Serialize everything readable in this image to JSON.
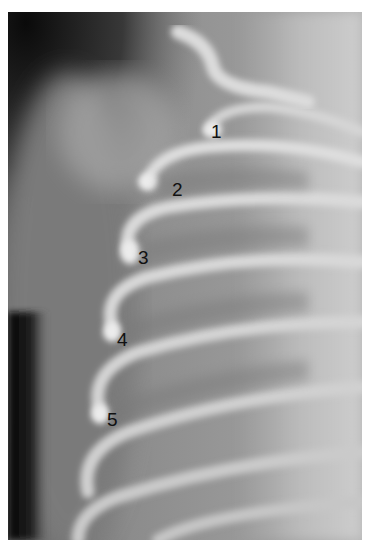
{
  "figure": {
    "caption_remnant": "ʼ ʼ ʼ",
    "labels": [
      {
        "text": "1",
        "x": 211,
        "y": 122
      },
      {
        "text": "2",
        "x": 172,
        "y": 180
      },
      {
        "text": "3",
        "x": 138,
        "y": 248
      },
      {
        "text": "4",
        "x": 117,
        "y": 330
      },
      {
        "text": "5",
        "x": 107,
        "y": 410
      }
    ],
    "colors": {
      "background": "#ffffff",
      "soft_tissue": "#8a8a8a",
      "air_dark": "#1a1a1a",
      "bone": "#e6e6e6",
      "label_text": "#111111"
    }
  }
}
